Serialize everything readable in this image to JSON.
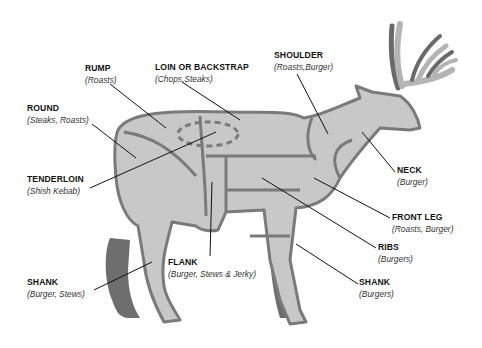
{
  "diagram": {
    "colors": {
      "cut_fill": "#c8c8c8",
      "outline": "#7a7a7a",
      "dark_limb": "#6e6e6e",
      "antler_light": "#b4b4b4",
      "antler_dark": "#6a6a6a",
      "leader_line": "#111111"
    },
    "labels": [
      {
        "id": "rump",
        "name": "RUMP",
        "use": "(Roasts)",
        "x": 85,
        "y": 64
      },
      {
        "id": "loin",
        "name": "LOIN OR BACKSTRAP",
        "use": "(Chops,Steaks)",
        "x": 155,
        "y": 63
      },
      {
        "id": "shoulder",
        "name": "SHOULDER",
        "use": "(Roasts,Burger)",
        "x": 274,
        "y": 51
      },
      {
        "id": "round",
        "name": "ROUND",
        "use": "(Steaks, Roasts)",
        "x": 27,
        "y": 104
      },
      {
        "id": "tenderloin",
        "name": "TENDERLOIN",
        "use": "(Shish Kebab)",
        "x": 27,
        "y": 175
      },
      {
        "id": "neck",
        "name": "NECK",
        "use": "(Burger)",
        "x": 397,
        "y": 166
      },
      {
        "id": "front-leg",
        "name": "FRONT LEG",
        "use": "(Roasts, Burger)",
        "x": 392,
        "y": 213
      },
      {
        "id": "ribs",
        "name": "RIBS",
        "use": "(Burgers)",
        "x": 378,
        "y": 243
      },
      {
        "id": "flank",
        "name": "FLANK",
        "use": "(Burger, Stews & Jerky)",
        "x": 168,
        "y": 258
      },
      {
        "id": "shank-rear",
        "name": "SHANK",
        "use": "(Burger, Stews)",
        "x": 27,
        "y": 278
      },
      {
        "id": "shank-front",
        "name": "SHANK",
        "use": "(Burgers)",
        "x": 359,
        "y": 278
      }
    ]
  }
}
